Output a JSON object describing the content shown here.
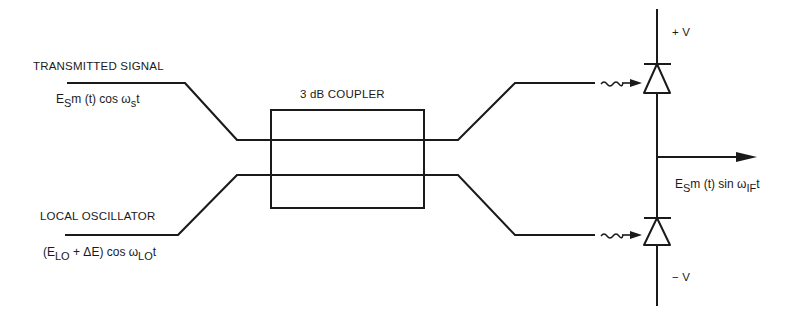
{
  "diagram": {
    "type": "balanced-mixer-schematic",
    "labels": {
      "transmitted_signal": "TRANSMITTED SIGNAL",
      "local_oscillator": "LOCAL OSCILLATOR",
      "coupler": "3 dB COUPLER",
      "plus_v": "+ V",
      "minus_v": "− V"
    },
    "equations": {
      "ts": {
        "pre": "E",
        "sub1": "S",
        "mid": "m (t) cos ω",
        "sub2": "s",
        "post": "t"
      },
      "lo": {
        "pre": "(E",
        "sub1": "LO",
        "mid": " + ΔE) cos ω",
        "sub2": "LO",
        "post": "t"
      },
      "out": {
        "pre": "E",
        "sub1": "S",
        "mid": "m (t) sin ω",
        "sub2": "IF",
        "post": "t"
      }
    },
    "colors": {
      "line": "#1a1a1a",
      "background": "#ffffff"
    }
  }
}
